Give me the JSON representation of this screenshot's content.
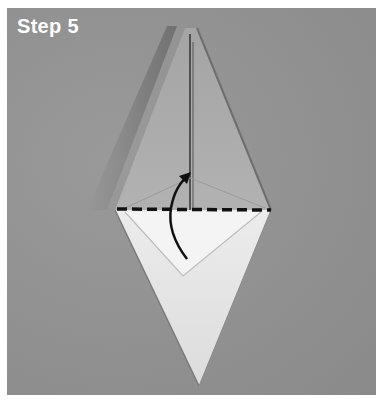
{
  "caption": {
    "step_label": "Step 5"
  },
  "diagram": {
    "fold_line": "dashed horizontal valley fold line",
    "arrow": "curved arrow pointing upward (fold bottom up)",
    "colors": {
      "background": "#909090",
      "paper_upper": "#a8a8a8",
      "paper_lower": "#e6e6e6",
      "ink": "#111111",
      "label": "#ffffff"
    }
  }
}
